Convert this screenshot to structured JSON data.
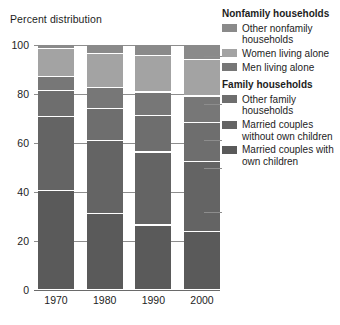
{
  "chart_data": {
    "type": "bar",
    "subtype": "stacked-percent",
    "title": "Percent distribution",
    "xlabel": "",
    "ylabel": "Percent distribution",
    "ylim": [
      0,
      100
    ],
    "yticks": [
      0,
      20,
      40,
      60,
      80,
      100
    ],
    "grid": true,
    "legend_position": "right",
    "categories": [
      "1970",
      "1980",
      "1990",
      "2000"
    ],
    "series": [
      {
        "name": "Married couples with own children",
        "group": "Family households",
        "color": "#5a5a5a",
        "values": [
          40.3,
          30.9,
          26.3,
          23.5
        ]
      },
      {
        "name": "Married couples without own children",
        "group": "Family households",
        "color": "#646464",
        "values": [
          30.3,
          29.9,
          29.8,
          28.7
        ]
      },
      {
        "name": "Other family households",
        "group": "Family households",
        "color": "#6e6e6e",
        "values": [
          10.6,
          12.9,
          14.8,
          16.0
        ]
      },
      {
        "name": "Men living alone",
        "group": "Nonfamily households",
        "color": "#777777",
        "values": [
          5.6,
          8.6,
          9.7,
          10.7
        ]
      },
      {
        "name": "Women living alone",
        "group": "Nonfamily households",
        "color": "#a3a3a3",
        "values": [
          11.5,
          14.0,
          14.9,
          14.8
        ]
      },
      {
        "name": "Other nonfamily households",
        "group": "Nonfamily households",
        "color": "#8a8a8a",
        "values": [
          1.7,
          3.7,
          4.5,
          6.3
        ]
      }
    ]
  },
  "legend": {
    "groups": [
      {
        "heading": "Nonfamily households",
        "items": [
          {
            "label": "Other nonfamily households",
            "color": "#8a8a8a"
          },
          {
            "label": "Women living alone",
            "color": "#a3a3a3"
          },
          {
            "label": "Men living alone",
            "color": "#777777"
          }
        ]
      },
      {
        "heading": "Family households",
        "items": [
          {
            "label": "Other family households",
            "color": "#6e6e6e"
          },
          {
            "label": "Married couples without own children",
            "color": "#646464"
          },
          {
            "label": "Married couples with own children",
            "color": "#5a5a5a"
          }
        ]
      }
    ]
  }
}
